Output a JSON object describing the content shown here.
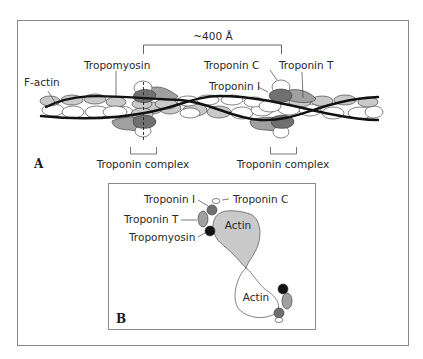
{
  "figure": {
    "panel_a": {
      "letter": "A",
      "spacing_label": "~400 Å",
      "labels": {
        "f_actin": "F-actin",
        "tropomyosin": "Tropomyosin",
        "troponin_c": "Troponin C",
        "troponin_t": "Troponin T",
        "troponin_i": "Troponin I",
        "troponin_complex_1": "Troponin complex",
        "troponin_complex_2": "Troponin complex"
      }
    },
    "panel_b": {
      "letter": "B",
      "labels": {
        "troponin_i": "Troponin I",
        "troponin_c": "Troponin C",
        "troponin_t": "Troponin T",
        "tropomyosin": "Tropomyosin",
        "actin_top": "Actin",
        "actin_bottom": "Actin"
      }
    },
    "colors": {
      "frame": "#8a8a8a",
      "light_gray": "#c9c9c9",
      "medium_gray": "#a0a0a0",
      "dark_gray": "#707070",
      "strand": "#111111",
      "white": "#ffffff"
    }
  }
}
